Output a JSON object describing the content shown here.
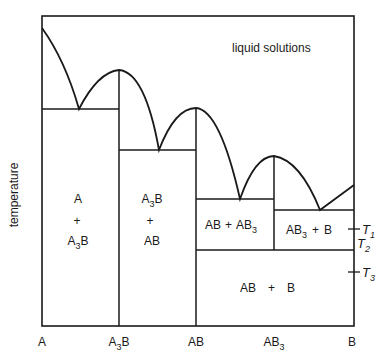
{
  "diagram": {
    "type": "binary phase diagram (temperature vs composition)",
    "y_axis_label": "temperature",
    "x_axis_ticks": [
      {
        "base": "A",
        "sub": ""
      },
      {
        "base": "A",
        "sub": "3",
        "tail": "B"
      },
      {
        "base": "AB",
        "sub": ""
      },
      {
        "base": "AB",
        "sub": "3"
      },
      {
        "base": "B",
        "sub": ""
      }
    ],
    "region_labels": {
      "liquid": "liquid solutions",
      "r1_top": "A",
      "r1_plus": "+",
      "r1_bottom_base": "A",
      "r1_bottom_sub": "3",
      "r1_bottom_tail": "B",
      "r2_top_base": "A",
      "r2_top_sub": "3",
      "r2_top_tail": "B",
      "r2_plus": "+",
      "r2_bottom": "AB",
      "r3_left": "AB",
      "r3_plus": "+",
      "r3_right_base": "AB",
      "r3_right_sub": "3",
      "r4_left_base": "AB",
      "r4_left_sub": "3",
      "r4_plus": "+",
      "r4_right": "B",
      "r5_left": "AB",
      "r5_plus": "+",
      "r5_right": "B"
    },
    "temperature_markers": [
      {
        "base": "T",
        "sub": "1"
      },
      {
        "base": "T",
        "sub": "2"
      },
      {
        "base": "T",
        "sub": "3"
      }
    ],
    "line_color": "#1a1a1a"
  }
}
